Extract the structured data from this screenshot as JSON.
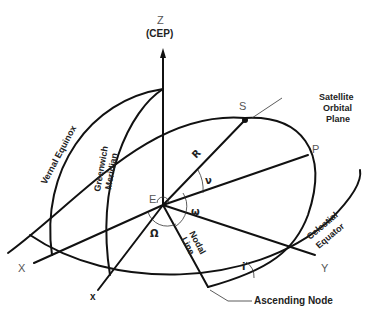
{
  "diagram": {
    "axes": {
      "z_label": "Z",
      "z_sublabel": "(CEP)",
      "x_label": "X",
      "y_label": "Y",
      "x_small_label": "x"
    },
    "points": {
      "earth": "E",
      "satellite": "S",
      "perigee": "P"
    },
    "curves": {
      "vernal_equinox": "Vernal Equinox",
      "greenwich_line1": "Greenwich",
      "greenwich_line2": "Meridian",
      "orbital_plane_line1": "Satellite",
      "orbital_plane_line2": "Orbital",
      "orbital_plane_line3": "Plane",
      "celestial_line1": "Celestial",
      "celestial_line2": "Equator",
      "nodal_line1": "Nodal",
      "nodal_line2": "Line"
    },
    "symbols": {
      "radius": "R",
      "true_anomaly": "ν",
      "arg_perigee": "ω",
      "raan": "Ω",
      "inclination": "i"
    },
    "callouts": {
      "ascending_node": "Ascending Node"
    }
  }
}
